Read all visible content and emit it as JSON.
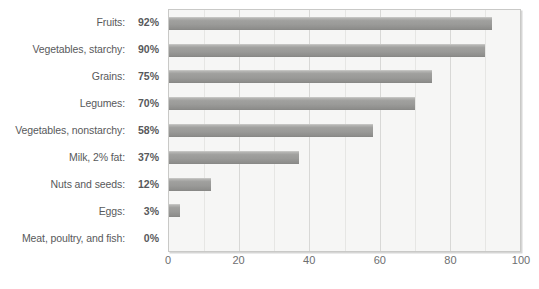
{
  "chart_data": {
    "type": "bar",
    "orientation": "horizontal",
    "title": "",
    "xlabel": "",
    "ylabel": "",
    "xlim": [
      0,
      100
    ],
    "xticks": [
      0,
      20,
      40,
      60,
      80,
      100
    ],
    "xtick_labels": [
      "0",
      "20",
      "40",
      "60",
      "80",
      "100"
    ],
    "grid": true,
    "gridline_axis": "x",
    "legend": false,
    "bar_color": "#9a9a98",
    "plot_background": "#f6f6f5",
    "frame_color": "#c9c9c7",
    "text_color": "#58595b",
    "categories": [
      "Fruits",
      "Vegetables, starchy",
      "Grains",
      "Legumes",
      "Vegetables, nonstarchy",
      "Milk, 2% fat",
      "Nuts and seeds",
      "Eggs",
      "Meat, poultry, and fish"
    ],
    "values": [
      92,
      90,
      75,
      70,
      58,
      37,
      12,
      3,
      0
    ],
    "value_labels": [
      "92%",
      "90%",
      "75%",
      "70%",
      "58%",
      "37%",
      "12%",
      "3%",
      "0%"
    ],
    "rows": [
      {
        "label": "Fruits:",
        "value_label": "92%",
        "value": 92
      },
      {
        "label": "Vegetables, starchy:",
        "value_label": "90%",
        "value": 90
      },
      {
        "label": "Grains:",
        "value_label": "75%",
        "value": 75
      },
      {
        "label": "Legumes:",
        "value_label": "70%",
        "value": 70
      },
      {
        "label": "Vegetables, nonstarchy:",
        "value_label": "58%",
        "value": 58
      },
      {
        "label": "Milk, 2% fat:",
        "value_label": "37%",
        "value": 37
      },
      {
        "label": "Nuts and seeds:",
        "value_label": "12%",
        "value": 12
      },
      {
        "label": "Eggs:",
        "value_label": "3%",
        "value": 3
      },
      {
        "label": "Meat, poultry, and fish:",
        "value_label": "0%",
        "value": 0
      }
    ]
  }
}
